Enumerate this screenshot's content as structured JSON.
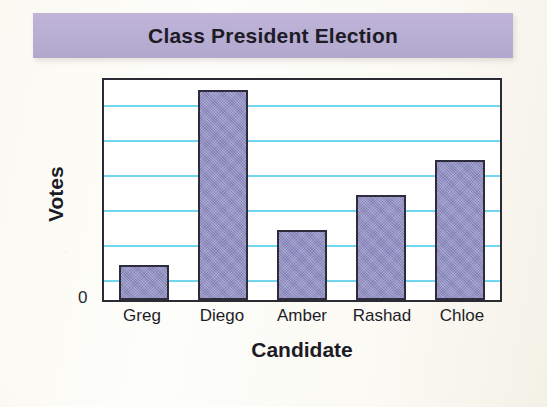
{
  "banner": {
    "title": "Class President Election",
    "background_color": "#b9aed4"
  },
  "chart_data": {
    "type": "bar",
    "title": "Class President Election",
    "xlabel": "Candidate",
    "ylabel": "Votes",
    "categories": [
      "Greg",
      "Diego",
      "Amber",
      "Rashad",
      "Chloe"
    ],
    "values": [
      1,
      6,
      2,
      3,
      4
    ],
    "ylim": [
      0,
      7
    ],
    "y_tick_labels": [
      "0"
    ],
    "gridlines": 6,
    "grid": true,
    "grid_color": "#67d2f0",
    "legend": "none",
    "bar_color": "#8e8cc4",
    "bar_outline_color": "#2e2c3a",
    "axis_color": "#2b2b33"
  }
}
